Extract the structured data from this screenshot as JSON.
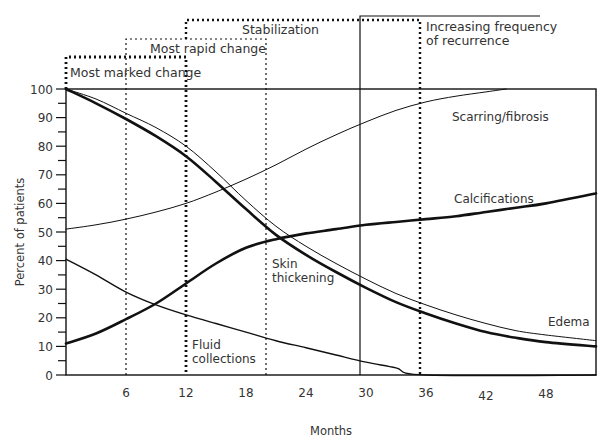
{
  "chart_data": {
    "type": "line",
    "title": "",
    "xlabel": "Months",
    "ylabel": "Percent of patients",
    "xlim": [
      0,
      53
    ],
    "ylim": [
      0,
      100
    ],
    "x_ticks": [
      6,
      12,
      18,
      24,
      30,
      36,
      42,
      48
    ],
    "y_ticks": [
      0,
      10,
      20,
      30,
      40,
      50,
      60,
      70,
      80,
      90,
      100
    ],
    "grid": false,
    "legend": "inline labels",
    "series": [
      {
        "name": "Scarring/fibrosis",
        "label_pos": [
          38.5,
          90
        ],
        "stroke_width": 1,
        "x": [
          0,
          3,
          6,
          9,
          12,
          15,
          18,
          21,
          24,
          27,
          30,
          33,
          36,
          39,
          42,
          44
        ],
        "y": [
          51,
          52.5,
          54.5,
          57,
          60,
          64,
          68.5,
          73.5,
          79,
          84,
          88.5,
          92.5,
          95.5,
          97.5,
          99,
          100
        ]
      },
      {
        "name": "Calcifications",
        "label_pos": [
          38.7,
          61
        ],
        "stroke_width": 2.6,
        "x": [
          0,
          3,
          6,
          9,
          12,
          15,
          18,
          21,
          24,
          27,
          30,
          33,
          36,
          39,
          42,
          45,
          48,
          53
        ],
        "y": [
          11,
          14.5,
          19.5,
          25,
          32,
          39,
          44.5,
          47.5,
          49.5,
          51,
          52.5,
          53.5,
          54.5,
          55.5,
          57,
          58.5,
          60,
          63.5
        ]
      },
      {
        "name": "Skin thickening",
        "label_pos": [
          18.3,
          35
        ],
        "stroke_width": 2.6,
        "x": [
          0,
          3,
          6,
          9,
          12,
          15,
          18,
          21,
          24,
          27,
          30,
          33,
          36,
          39,
          42,
          45,
          48,
          53
        ],
        "y": [
          100,
          95,
          89.5,
          83.5,
          76.5,
          67.5,
          58,
          49,
          42,
          36,
          30.5,
          25.5,
          21.5,
          18,
          15,
          13,
          11.5,
          10
        ]
      },
      {
        "name": "Edema",
        "label_pos": [
          47.2,
          18
        ],
        "stroke_width": 1,
        "x": [
          0,
          3,
          6,
          9,
          12,
          15,
          18,
          21,
          24,
          27,
          30,
          33,
          36,
          39,
          42,
          45,
          48,
          53
        ],
        "y": [
          100,
          96.5,
          91.5,
          86.5,
          80,
          71,
          61,
          52,
          45,
          39,
          33.5,
          28.5,
          24.5,
          21,
          18,
          15.5,
          14,
          12
        ]
      },
      {
        "name": "Fluid collections",
        "label_pos": [
          12.6,
          11
        ],
        "stroke_width": 1.4,
        "x": [
          0,
          3,
          6,
          9,
          12,
          15,
          18,
          21,
          24,
          27,
          30,
          33,
          36,
          53
        ],
        "y": [
          40.5,
          35,
          29,
          24.5,
          21,
          18,
          15,
          12,
          9.5,
          7,
          4.5,
          2.5,
          0,
          0
        ]
      }
    ],
    "annotations": [
      {
        "label": "Most marked change",
        "x_start": 0,
        "x_end": 12,
        "style": "heavy-dotted"
      },
      {
        "label": "Most rapid change",
        "x_start": 6,
        "x_end": 18,
        "style": "light-dotted"
      },
      {
        "label": "Stabilization",
        "x_start": 12,
        "x_end": 36,
        "style": "dotted"
      },
      {
        "label": "Increasing frequency of recurrence",
        "x_start": 30,
        "x_end": null,
        "style": "solid"
      }
    ]
  },
  "labels": {
    "ylabel": "Percent of patients",
    "xlabel": "Months",
    "phase_most_marked": "Most marked change",
    "phase_most_rapid": "Most rapid change",
    "phase_stabilization": "Stabilization",
    "phase_recurrence_line1": "Increasing frequency",
    "phase_recurrence_line2": "of recurrence",
    "series_scarring": "Scarring/fibrosis",
    "series_calcifications": "Calcifications",
    "series_skin_line1": "Skin",
    "series_skin_line2": "thickening",
    "series_edema": "Edema",
    "series_fluid_line1": "Fluid",
    "series_fluid_line2": "collections"
  }
}
